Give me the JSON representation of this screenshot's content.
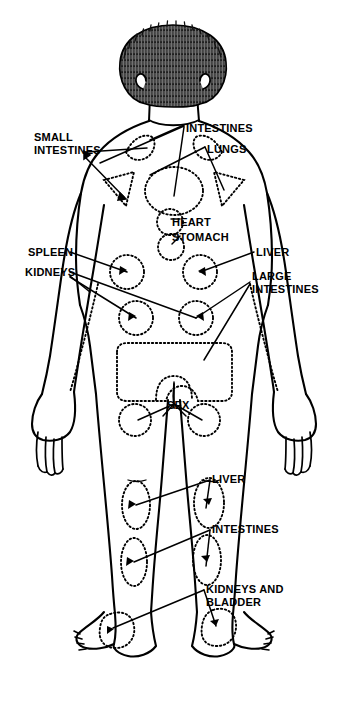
{
  "diagram": {
    "view": "posterior",
    "line_color": "#000000",
    "background": "#ffffff",
    "zone_style": "dotted-outline"
  },
  "labels": [
    {
      "id": "small-intestines",
      "text": "SMALL\nINTESTINES",
      "x": 34,
      "y": 131,
      "align": "left"
    },
    {
      "id": "intestines-top",
      "text": "INTESTINES",
      "x": 186,
      "y": 122,
      "align": "left"
    },
    {
      "id": "lungs",
      "text": "LUNGS",
      "x": 207,
      "y": 143,
      "align": "left"
    },
    {
      "id": "heart",
      "text": "HEART",
      "x": 172,
      "y": 216,
      "align": "left"
    },
    {
      "id": "stomach",
      "text": "STOMACH",
      "x": 172,
      "y": 231,
      "align": "left"
    },
    {
      "id": "spleen",
      "text": "SPLEEN",
      "x": 28,
      "y": 251,
      "align": "left"
    },
    {
      "id": "kidneys",
      "text": "KIDNEYS",
      "x": 25,
      "y": 271,
      "align": "left"
    },
    {
      "id": "liver-upper",
      "text": "LIVER",
      "x": 256,
      "y": 251,
      "align": "left"
    },
    {
      "id": "large-intestines",
      "text": "LARGE\nINTESTINES",
      "x": 252,
      "y": 275,
      "align": "left"
    },
    {
      "id": "sex",
      "text": "SEX",
      "x": 167,
      "y": 399,
      "align": "left"
    },
    {
      "id": "liver-leg",
      "text": "LIVER",
      "x": 212,
      "y": 477,
      "align": "left"
    },
    {
      "id": "intestines-leg",
      "text": "INTESTINES",
      "x": 212,
      "y": 527,
      "align": "left"
    },
    {
      "id": "kidneys-bladder",
      "text": "KIDNEYS AND\nBLADDER",
      "x": 206,
      "y": 588,
      "align": "left"
    }
  ],
  "zones": [
    {
      "id": "zone-shoulder-left",
      "organ": "SMALL INTESTINES",
      "shape": "wedge"
    },
    {
      "id": "zone-shoulder-right",
      "organ": "INTESTINES",
      "shape": "wedge"
    },
    {
      "id": "zone-scapula-left",
      "organ": "SMALL INTESTINES",
      "shape": "triangle"
    },
    {
      "id": "zone-scapula-right",
      "organ": "LUNGS",
      "shape": "triangle"
    },
    {
      "id": "zone-spine-upper",
      "organ": "LUNGS",
      "shape": "oval"
    },
    {
      "id": "zone-heart",
      "organ": "HEART",
      "shape": "circle"
    },
    {
      "id": "zone-stomach",
      "organ": "STOMACH",
      "shape": "circle"
    },
    {
      "id": "zone-flank-left",
      "organ": "SPLEEN",
      "shape": "circle"
    },
    {
      "id": "zone-flank-right",
      "organ": "LIVER",
      "shape": "circle"
    },
    {
      "id": "zone-kidney-left",
      "organ": "KIDNEYS",
      "shape": "circle"
    },
    {
      "id": "zone-kidney-right",
      "organ": "KIDNEYS",
      "shape": "circle"
    },
    {
      "id": "zone-large-intestines",
      "organ": "LARGE INTESTINES",
      "shape": "rounded-rect"
    },
    {
      "id": "zone-sacrum",
      "organ": "SEX",
      "shape": "arch"
    },
    {
      "id": "zone-buttock-left",
      "organ": "SEX",
      "shape": "circle"
    },
    {
      "id": "zone-buttock-right",
      "organ": "SEX",
      "shape": "circle"
    },
    {
      "id": "zone-thigh-left",
      "organ": "LIVER",
      "shape": "oval"
    },
    {
      "id": "zone-thigh-right",
      "organ": "LIVER",
      "shape": "oval"
    },
    {
      "id": "zone-calf-left",
      "organ": "INTESTINES",
      "shape": "oval"
    },
    {
      "id": "zone-calf-right",
      "organ": "INTESTINES",
      "shape": "oval"
    },
    {
      "id": "zone-heel-left",
      "organ": "KIDNEYS AND BLADDER",
      "shape": "blob"
    },
    {
      "id": "zone-heel-right",
      "organ": "KIDNEYS AND BLADDER",
      "shape": "blob"
    },
    {
      "id": "zone-forearm-left",
      "organ": "KIDNEYS",
      "shape": "dotted-line"
    },
    {
      "id": "zone-forearm-right",
      "organ": "LARGE INTESTINES",
      "shape": "dotted-line"
    }
  ]
}
